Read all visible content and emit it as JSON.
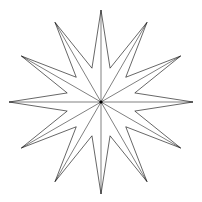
{
  "figure": {
    "shape": "twelve-pointed-star",
    "points": 12,
    "center": [
      101,
      102
    ],
    "outer_radius": 92,
    "inner_radius": 35,
    "stroke_color": "#000000",
    "fill_color": "#ffffff",
    "spokes_to_center": true
  }
}
